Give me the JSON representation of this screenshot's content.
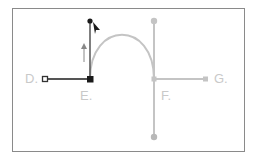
{
  "diagram": {
    "labels": {
      "d": "D.",
      "e": "E.",
      "f": "F.",
      "g": "G."
    },
    "colors": {
      "frame": "#8a8a8a",
      "active": "#1a1a1a",
      "active_line": "#555555",
      "inactive": "#c4c4c4",
      "label": "#c9c9c9",
      "background": "#ffffff"
    },
    "points": {
      "D": {
        "x": 45,
        "y": 79,
        "type": "hollow-square"
      },
      "E": {
        "x": 90,
        "y": 79,
        "type": "filled-square"
      },
      "E_handle": {
        "x": 90,
        "y": 21,
        "type": "filled-dot"
      },
      "F": {
        "x": 154,
        "y": 79,
        "type": "grey-anchor"
      },
      "F_handle_top": {
        "x": 154,
        "y": 21,
        "type": "grey-dot"
      },
      "F_handle_bottom": {
        "x": 154,
        "y": 137,
        "type": "grey-dot"
      },
      "G": {
        "x": 206,
        "y": 79,
        "type": "grey-square"
      }
    },
    "cursor": "pen-arrow-cursor",
    "direction_hint": "up-arrow"
  }
}
